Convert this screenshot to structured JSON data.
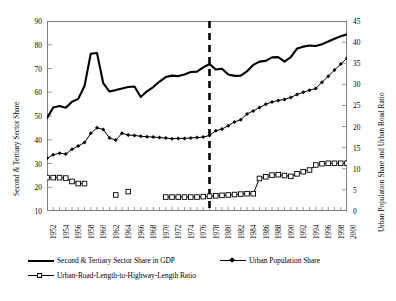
{
  "chart_data": {
    "type": "line",
    "title": "",
    "xlabel": "",
    "ylabel": "Second & Tertiary Sector Share",
    "ylabel_right": "Urban Population Share and Urban Road Ratio",
    "ylim": [
      10,
      90
    ],
    "ylim_right": [
      0,
      45
    ],
    "ytick_labels": [
      "90",
      "80",
      "70",
      "60",
      "50",
      "40",
      "30",
      "20",
      "10"
    ],
    "ytick_values": [
      90,
      80,
      70,
      60,
      50,
      40,
      30,
      20,
      10
    ],
    "ytick_right_labels": [
      "45",
      "40",
      "35",
      "30",
      "25",
      "20",
      "15",
      "10",
      "5",
      "0"
    ],
    "ytick_right_values": [
      45,
      40,
      35,
      30,
      25,
      20,
      15,
      10,
      5,
      0
    ],
    "grid": false,
    "legend_position": "bottom",
    "x": [
      1952,
      1953,
      1954,
      1955,
      1956,
      1957,
      1958,
      1959,
      1960,
      1961,
      1962,
      1963,
      1964,
      1965,
      1966,
      1967,
      1968,
      1969,
      1970,
      1971,
      1972,
      1973,
      1974,
      1975,
      1976,
      1977,
      1978,
      1979,
      1980,
      1981,
      1982,
      1983,
      1984,
      1985,
      1986,
      1987,
      1988,
      1989,
      1990,
      1991,
      1992,
      1993,
      1994,
      1995,
      1996,
      1997,
      1998,
      1999,
      2000
    ],
    "xtick_labels": [
      "1952",
      "1954",
      "1956",
      "1958",
      "1960",
      "1962",
      "1964",
      "1966",
      "1968",
      "1970",
      "1972",
      "1974",
      "1976",
      "1978",
      "1980",
      "1982",
      "1984",
      "1986",
      "1988",
      "1990",
      "1992",
      "1994",
      "1996",
      "1998",
      "2000"
    ],
    "annotations": [
      {
        "type": "vline",
        "x": 1978,
        "style": "dashed",
        "label": "1978 reform"
      }
    ],
    "series": [
      {
        "name": "Second & Tertiary Sector Share in GDP",
        "axis": "left",
        "marker": "none",
        "line": "thick-solid",
        "values": [
          49.1,
          53.6,
          54.2,
          53.5,
          56.0,
          57.2,
          62.6,
          76.2,
          76.5,
          63.8,
          60.3,
          60.9,
          61.6,
          62.2,
          62.4,
          58.0,
          60.4,
          62.2,
          64.5,
          66.4,
          67.0,
          66.8,
          67.5,
          68.5,
          68.7,
          70.5,
          71.9,
          69.6,
          69.9,
          67.5,
          66.9,
          67.0,
          68.8,
          71.5,
          72.9,
          73.2,
          74.7,
          74.8,
          72.9,
          74.8,
          78.4,
          79.2,
          79.7,
          79.5,
          80.2,
          81.4,
          82.5,
          83.6,
          84.4
        ]
      },
      {
        "name": "Urban Population Share",
        "axis": "right",
        "marker": "filled-diamond",
        "line": "solid",
        "values": [
          12.5,
          13.3,
          13.7,
          13.5,
          14.6,
          15.4,
          16.2,
          18.4,
          19.7,
          19.3,
          17.3,
          16.8,
          18.4,
          18.0,
          17.9,
          17.7,
          17.6,
          17.5,
          17.4,
          17.3,
          17.1,
          17.2,
          17.2,
          17.3,
          17.4,
          17.5,
          17.9,
          19.0,
          19.4,
          20.2,
          21.1,
          21.6,
          23.0,
          23.7,
          24.5,
          25.3,
          25.8,
          26.2,
          26.4,
          26.9,
          27.6,
          28.1,
          28.6,
          29.0,
          30.5,
          31.9,
          33.4,
          34.8,
          36.2
        ]
      },
      {
        "name": "Urban-Road-Length-to-Highway-Length Ratio",
        "axis": "right",
        "marker": "open-square",
        "line": "solid-gapped",
        "values": [
          7.9,
          7.9,
          7.9,
          7.8,
          7.0,
          6.5,
          6.5,
          null,
          null,
          null,
          null,
          3.8,
          null,
          4.6,
          null,
          null,
          null,
          null,
          null,
          3.3,
          3.3,
          3.3,
          3.3,
          3.3,
          3.3,
          3.4,
          3.5,
          3.6,
          3.7,
          3.8,
          3.9,
          4.0,
          4.1,
          4.1,
          7.7,
          8.1,
          8.5,
          8.6,
          8.4,
          8.2,
          8.8,
          9.3,
          9.7,
          10.9,
          11.2,
          11.3,
          11.3,
          11.3,
          11.3
        ]
      }
    ]
  },
  "legend": {
    "items": [
      {
        "label": "Second & Tertiary Sector Share in GDP",
        "marker": "thick-line"
      },
      {
        "label": "Urban Population Share",
        "marker": "line-diamond"
      },
      {
        "label": "Urban-Road-Length-to-Highway-Length Ratio",
        "marker": "line-square"
      }
    ]
  }
}
